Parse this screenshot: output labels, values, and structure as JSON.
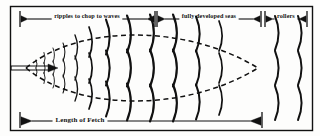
{
  "figure": {
    "background_color": "#fdfdfc",
    "ink_color": "#111111",
    "border": {
      "x": 10,
      "y": 6,
      "width": 302,
      "height": 124
    }
  },
  "top_scale": {
    "segments": [
      {
        "id": "ripples",
        "label": "ripples to chop to waves",
        "start_x": 20,
        "end_x": 155,
        "center_x": 87,
        "label_y": 13
      },
      {
        "id": "fully-developed",
        "label": "fully developed seas",
        "start_x": 157,
        "end_x": 261,
        "center_x": 209,
        "label_y": 13
      },
      {
        "id": "rollers",
        "label": "rollers",
        "start_x": 265,
        "end_x": 307,
        "center_x": 286,
        "label_y": 13
      }
    ],
    "axis_y": 19,
    "tick_top": 11,
    "tick_bottom": 27
  },
  "bottom_scale": {
    "label": "Length of Fetch",
    "label_center_x": 80,
    "label_y": 117,
    "start_x": 20,
    "end_x": 262,
    "axis_y": 121,
    "tick_top": 112,
    "tick_bottom": 128
  },
  "wind_arrow": {
    "name": "wind-direction-arrow",
    "start_x": 11,
    "end_x": 57,
    "y": 68,
    "double_line_offset": 2
  },
  "envelope": {
    "description": "dashed lens-shaped fetch envelope",
    "apex_left_x": 26,
    "apex_left_y": 68,
    "apex_right_x": 258,
    "apex_right_y": 68,
    "top_bulge_y": 27,
    "bottom_bulge_y": 109,
    "dash": "5,3.5"
  },
  "wave_columns": [
    {
      "x": 36,
      "arcs": 2,
      "size": 4,
      "spacing": 8
    },
    {
      "x": 44,
      "arcs": 3,
      "size": 5.5,
      "spacing": 10
    },
    {
      "x": 53,
      "arcs": 3,
      "size": 7,
      "spacing": 13
    },
    {
      "x": 63,
      "arcs": 3,
      "size": 9,
      "spacing": 16
    },
    {
      "x": 75,
      "arcs": 3,
      "size": 12,
      "spacing": 21
    },
    {
      "x": 89,
      "arcs": 3,
      "size": 15,
      "spacing": 26
    },
    {
      "x": 106,
      "arcs": 3,
      "size": 17.5,
      "spacing": 31
    },
    {
      "x": 127,
      "arcs": 3,
      "size": 18.5,
      "spacing": 34
    },
    {
      "x": 150,
      "arcs": 3,
      "size": 18.5,
      "spacing": 35
    },
    {
      "x": 173,
      "arcs": 3,
      "size": 18.5,
      "spacing": 35
    },
    {
      "x": 196,
      "arcs": 3,
      "size": 17.5,
      "spacing": 34
    },
    {
      "x": 219,
      "arcs": 3,
      "size": 15,
      "spacing": 32
    },
    {
      "x": 275,
      "arcs": 3,
      "size": 17,
      "spacing": 35
    },
    {
      "x": 298,
      "arcs": 3,
      "size": 17,
      "spacing": 35
    }
  ],
  "icons": {
    "arrow_head_left": "arrow-left-icon",
    "arrow_head_right": "arrow-right-icon",
    "tick": "tick-mark-icon"
  }
}
